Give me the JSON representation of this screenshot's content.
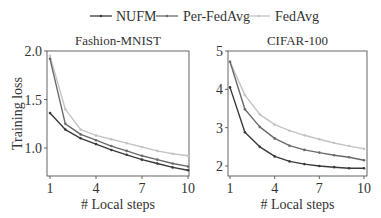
{
  "legend": {
    "items": [
      {
        "label": "NUFM",
        "color": "#3a3a3a"
      },
      {
        "label": "Per-FedAvg",
        "color": "#6a6a6a"
      },
      {
        "label": "FedAvg",
        "color": "#c4c4c4"
      }
    ]
  },
  "chart_data": [
    {
      "type": "line",
      "title": "Fashion-MNIST",
      "xlabel": "# Local steps",
      "ylabel": "Training loss",
      "x": [
        1,
        2,
        3,
        4,
        5,
        6,
        7,
        8,
        9,
        10
      ],
      "xticks": [
        "1",
        "4",
        "7",
        "10"
      ],
      "yticks": [
        "1.0",
        "1.5",
        "2.0"
      ],
      "ylim": [
        0.72,
        2.0
      ],
      "xlim": [
        0.8,
        10.05
      ],
      "grid": false,
      "legend_position": "top-center",
      "series": [
        {
          "name": "NUFM",
          "values": [
            1.36,
            1.19,
            1.1,
            1.04,
            0.98,
            0.93,
            0.88,
            0.84,
            0.8,
            0.77
          ]
        },
        {
          "name": "Per-FedAvg",
          "values": [
            1.92,
            1.25,
            1.14,
            1.08,
            1.02,
            0.97,
            0.92,
            0.88,
            0.84,
            0.81
          ]
        },
        {
          "name": "FedAvg",
          "values": [
            1.95,
            1.4,
            1.19,
            1.13,
            1.09,
            1.05,
            1.01,
            0.97,
            0.94,
            0.92
          ]
        }
      ]
    },
    {
      "type": "line",
      "title": "CIFAR-100",
      "xlabel": "# Local steps",
      "ylabel": "",
      "x": [
        1,
        2,
        3,
        4,
        5,
        6,
        7,
        8,
        9,
        10
      ],
      "xticks": [
        "1",
        "4",
        "7",
        "10"
      ],
      "yticks": [
        "2",
        "3",
        "4",
        "5"
      ],
      "ylim": [
        1.75,
        5.0
      ],
      "xlim": [
        0.8,
        10.05
      ],
      "grid": false,
      "series": [
        {
          "name": "NUFM",
          "values": [
            4.05,
            2.88,
            2.5,
            2.25,
            2.12,
            2.05,
            2.0,
            1.97,
            1.94,
            1.94
          ]
        },
        {
          "name": "Per-FedAvg",
          "values": [
            4.72,
            3.48,
            3.02,
            2.72,
            2.53,
            2.42,
            2.35,
            2.28,
            2.23,
            2.15
          ]
        },
        {
          "name": "FedAvg",
          "values": [
            4.72,
            3.85,
            3.35,
            3.08,
            2.92,
            2.8,
            2.7,
            2.6,
            2.52,
            2.45
          ]
        }
      ]
    }
  ]
}
